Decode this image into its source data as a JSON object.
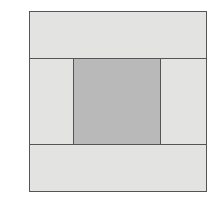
{
  "diagram": {
    "background_color": "#ffffff",
    "outer_frame": {
      "label": "outer-rectangle",
      "stroke_color": "#555555",
      "stroke_width": "1.5px",
      "fill_color": "#e3e3e1",
      "x": 29,
      "y": 11,
      "width": 178,
      "height": 181
    },
    "bands": [
      {
        "label": "top-band",
        "fill_color": "#e3e3e1",
        "height": 47,
        "caption": ""
      },
      {
        "label": "middle-band",
        "fill_color": "#e3e3e1",
        "height": 88,
        "caption": ""
      },
      {
        "label": "bottom-band",
        "fill_color": "#e3e3e1",
        "height": 46,
        "caption": ""
      }
    ],
    "middle_cells": [
      {
        "label": "left-cell",
        "fill_color": "#e3e3e1",
        "width": 44,
        "caption": ""
      },
      {
        "label": "center-cell",
        "fill_color": "#b9b9b9",
        "width": 87,
        "caption": ""
      },
      {
        "label": "right-cell",
        "fill_color": "#e3e3e1",
        "width": 45,
        "caption": ""
      }
    ]
  }
}
